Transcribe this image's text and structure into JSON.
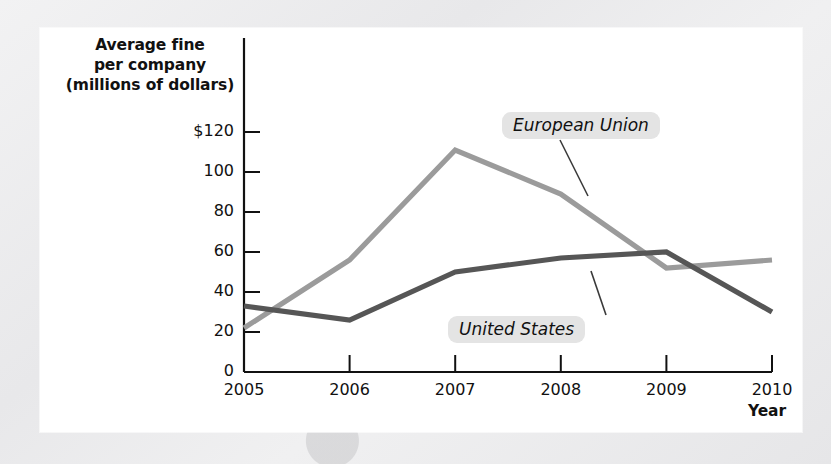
{
  "figure": {
    "y_axis_title": "Average fine\nper company\n(millions of dollars)",
    "x_axis_title": "Year"
  },
  "chart_data": {
    "type": "line",
    "title": "",
    "xlabel": "Year",
    "ylabel": "Average fine per company (millions of dollars)",
    "categories": [
      "2005",
      "2006",
      "2007",
      "2008",
      "2009",
      "2010"
    ],
    "x": [
      2005,
      2006,
      2007,
      2008,
      2009,
      2010
    ],
    "xlim": [
      2005,
      2010
    ],
    "ylim": [
      0,
      130
    ],
    "ytick_labels": [
      "$120",
      "100",
      "80",
      "60",
      "40",
      "20",
      "0"
    ],
    "ytick_values": [
      120,
      100,
      80,
      60,
      40,
      20,
      0
    ],
    "grid": false,
    "legend_position": "inline-annotations",
    "series": [
      {
        "name": "European Union",
        "color": "#9b9b9b",
        "values": [
          22,
          56,
          111,
          89,
          52,
          56
        ]
      },
      {
        "name": "United States",
        "color": "#565656",
        "values": [
          33,
          26,
          50,
          57,
          60,
          30
        ]
      }
    ],
    "annotations": [
      {
        "label": "European Union",
        "series": "European Union"
      },
      {
        "label": "United States",
        "series": "United States"
      }
    ]
  }
}
